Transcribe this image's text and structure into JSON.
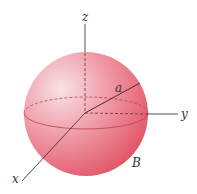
{
  "figure": {
    "type": "sphere-with-axes",
    "labels": {
      "z_axis": "z",
      "y_axis": "y",
      "x_axis": "x",
      "radius": "a",
      "region": "B"
    },
    "colors": {
      "sphere_highlight": "#f8dde2",
      "sphere_mid": "#ef8a97",
      "sphere_shadow": "#e04a5c",
      "axis": "#3a3a3a",
      "equator": "#b8404f"
    }
  }
}
